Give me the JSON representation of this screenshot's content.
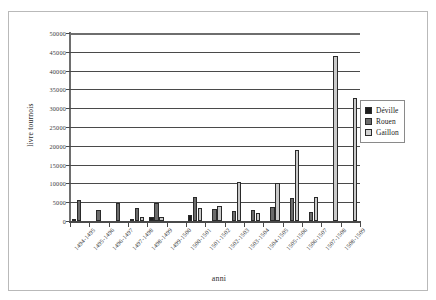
{
  "figure": {
    "ghost_header_text": "·  ··  ···   ·"
  },
  "axis": {
    "x_title": "anni",
    "y_title": "livre tournois"
  },
  "legend": {
    "items": [
      {
        "label": "Déville",
        "color": "#1d1d1d",
        "key": "deville"
      },
      {
        "label": "Rouen",
        "color": "#6b6b6b",
        "key": "rouen"
      },
      {
        "label": "Gaillon",
        "color": "#d2d2d2",
        "key": "gaillon"
      }
    ]
  },
  "chart_data": {
    "type": "bar",
    "title": "",
    "xlabel": "anni",
    "ylabel": "livre tournois",
    "ylim": [
      0,
      50000
    ],
    "ytick_step": 5000,
    "yticks": [
      0,
      5000,
      10000,
      15000,
      20000,
      25000,
      30000,
      35000,
      40000,
      45000,
      50000
    ],
    "ytick_labels": [
      "0",
      "5000",
      "10000",
      "15000",
      "20000",
      "25000",
      "30000",
      "35000",
      "40000",
      "45000",
      "50000"
    ],
    "grid": true,
    "grid_axis": "y",
    "legend_position": "right",
    "categories": [
      "1494-1495",
      "1495-1496",
      "1496-1497",
      "1497-1498",
      "1498-1499",
      "1499-1500",
      "1500-1501",
      "1501-1502",
      "1502-1503",
      "1503-1504",
      "1504-1505",
      "1505-1506",
      "1506-1507",
      "1507-1508",
      "1508-1509"
    ],
    "series": [
      {
        "name": "Déville",
        "color": "#1d1d1d",
        "values": [
          600,
          0,
          0,
          300,
          1200,
          0,
          1600,
          0,
          0,
          0,
          0,
          0,
          0,
          0,
          0
        ]
      },
      {
        "name": "Rouen",
        "color": "#6b6b6b",
        "values": [
          5600,
          2800,
          4900,
          3400,
          4900,
          0,
          6300,
          3200,
          2700,
          2900,
          3800,
          6200,
          2300,
          0,
          0
        ]
      },
      {
        "name": "Gaillon",
        "color": "#d2d2d2",
        "values": [
          0,
          0,
          0,
          1200,
          1000,
          0,
          3500,
          3900,
          10500,
          2100,
          10100,
          19000,
          6400,
          44000,
          32800
        ]
      }
    ]
  }
}
